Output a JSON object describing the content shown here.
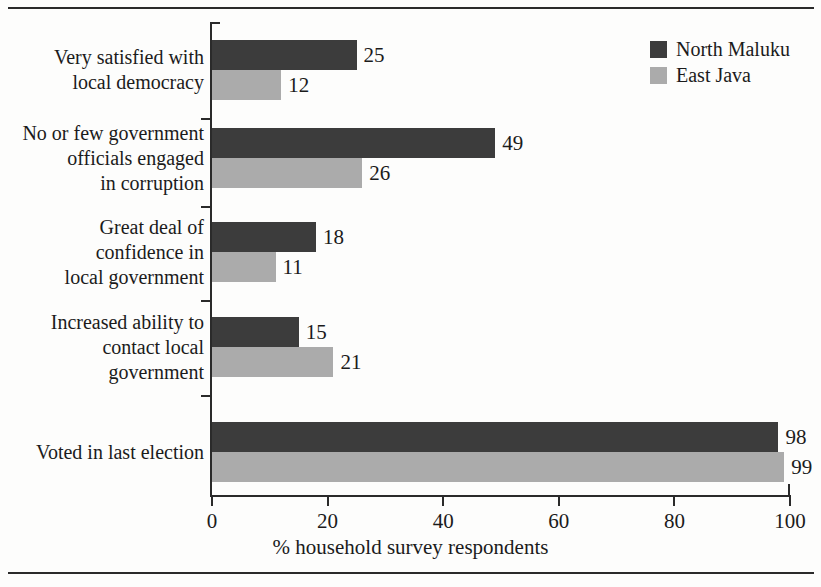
{
  "chart_data": {
    "type": "bar",
    "orientation": "horizontal",
    "title": "",
    "xlabel": "% household survey respondents",
    "ylabel": "",
    "xlim": [
      0,
      100
    ],
    "xticks": [
      0,
      20,
      40,
      60,
      80,
      100
    ],
    "grid": false,
    "legend_position": "top-right",
    "categories": [
      "Very satisfied with local democracy",
      "No or few government officials engaged in corruption",
      "Great deal of confidence in local government",
      "Increased ability to contact local government",
      "Voted in last election"
    ],
    "category_lines": [
      [
        "Very satisfied with",
        "local democracy"
      ],
      [
        "No or few government",
        "officials engaged",
        "in corruption"
      ],
      [
        "Great deal of",
        "confidence in",
        "local government"
      ],
      [
        "Increased ability to",
        "contact local",
        "government"
      ],
      [
        "Voted in last election"
      ]
    ],
    "series": [
      {
        "name": "North Maluku",
        "color": "#3c3c3c",
        "values": [
          25,
          49,
          18,
          15,
          98
        ]
      },
      {
        "name": "East Java",
        "color": "#ababab",
        "values": [
          12,
          26,
          11,
          21,
          99
        ]
      }
    ]
  },
  "legend": {
    "items": [
      {
        "label": "North Maluku",
        "color": "#3c3c3c"
      },
      {
        "label": "East Java",
        "color": "#ababab"
      }
    ]
  },
  "axis": {
    "x_title": "% household survey respondents",
    "tick_labels": [
      "0",
      "20",
      "40",
      "60",
      "80",
      "100"
    ]
  }
}
